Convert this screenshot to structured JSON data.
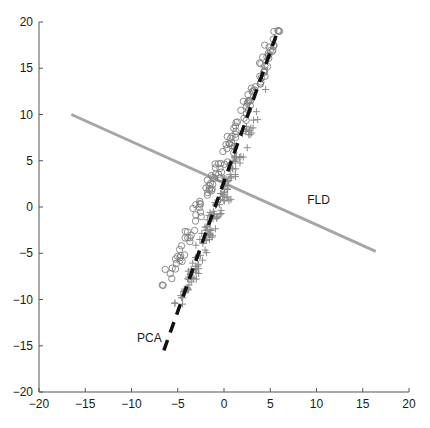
{
  "chart_data": {
    "type": "scatter",
    "title": "",
    "xlabel": "",
    "ylabel": "",
    "xlim": [
      -20,
      20
    ],
    "ylim": [
      -20,
      20
    ],
    "grid": false,
    "legend": null,
    "xticks": [
      -20,
      -15,
      -10,
      -5,
      0,
      5,
      10,
      15,
      20
    ],
    "yticks": [
      -20,
      -15,
      -10,
      -5,
      0,
      5,
      10,
      15,
      20
    ],
    "xtick_labels": [
      "−20",
      "−15",
      "−10",
      "−5",
      "0",
      "5",
      "10",
      "15",
      "20"
    ],
    "ytick_labels": [
      "−20",
      "−15",
      "−10",
      "−5",
      "0",
      "5",
      "10",
      "15",
      "20"
    ],
    "series": [
      {
        "name": "class-1",
        "marker": "circle",
        "color": "#808080",
        "band": {
          "start": [
            -6.3,
            -8.6
          ],
          "end": [
            6.0,
            19.0
          ],
          "count": 120,
          "spread": 0.35
        },
        "extra_points": [
          [
            -5.8,
            -7.2
          ],
          [
            -5.6,
            -6.6
          ],
          [
            -4.8,
            -4.6
          ],
          [
            -4.6,
            -4.2
          ],
          [
            4.3,
            14.6
          ],
          [
            4.4,
            14.8
          ],
          [
            5.2,
            16.8
          ],
          [
            5.4,
            17.5
          ],
          [
            6.0,
            19.0
          ]
        ]
      },
      {
        "name": "class-2",
        "marker": "cross",
        "color": "#8c8c8c",
        "band": {
          "start": [
            -5.0,
            -11.0
          ],
          "end": [
            3.6,
            10.3
          ],
          "count": 140,
          "spread": 0.35
        },
        "extra_points": [
          [
            -4.2,
            -9.2
          ],
          [
            -4.6,
            -9.8
          ],
          [
            -3.0,
            -7.8
          ],
          [
            3.2,
            9.4
          ],
          [
            3.5,
            10.3
          ],
          [
            3.0,
            8.0
          ],
          [
            4.5,
            12.7
          ]
        ]
      }
    ],
    "lines": [
      {
        "name": "FLD",
        "style": "solid",
        "color": "#a6a6a6",
        "width": 3,
        "from": [
          -16.5,
          10.0
        ],
        "to": [
          16.4,
          -4.8
        ]
      },
      {
        "name": "PCA",
        "style": "dashed",
        "color": "#111111",
        "width": 3.5,
        "from": [
          -6.5,
          -15.5
        ],
        "to": [
          5.8,
          19.0
        ]
      }
    ],
    "annotations": [
      {
        "text": "FLD",
        "x": 9.0,
        "y": 0.3
      },
      {
        "text": "PCA",
        "x": -9.4,
        "y": -14.6
      }
    ]
  },
  "labels": {
    "fld": "FLD",
    "pca": "PCA"
  }
}
